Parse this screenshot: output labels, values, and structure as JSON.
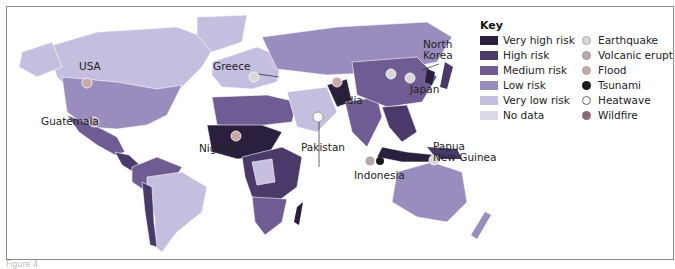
{
  "colors": {
    "very_high": "#2a1f3d",
    "high": "#4a3a6a",
    "medium": "#6e5c92",
    "low": "#9a8cbd",
    "very_low": "#c6bedf",
    "no_data": "#dcd8e6",
    "earthquake": "#d8d8d8",
    "volcanic": "#b8a8b0",
    "flood": "#c9a8a8",
    "tsunami": "#1c1c1c",
    "heatwave": "#ffffff",
    "wildfire": "#8a6a78"
  },
  "key": {
    "title": "Key",
    "risk_levels": [
      {
        "label": "Very high risk",
        "color": "#2a1f3d"
      },
      {
        "label": "High risk",
        "color": "#4a3a6a"
      },
      {
        "label": "Medium risk",
        "color": "#6e5c92"
      },
      {
        "label": "Low risk",
        "color": "#9a8cbd"
      },
      {
        "label": "Very low risk",
        "color": "#c6bedf"
      },
      {
        "label": "No data",
        "color": "#dcd8e6"
      }
    ],
    "hazards": [
      {
        "label": "Earthquake",
        "icon": "earthquake-dot-icon"
      },
      {
        "label": "Volcanic eruption",
        "icon": "volcano-dot-icon"
      },
      {
        "label": "Flood",
        "icon": "flood-dot-icon"
      },
      {
        "label": "Tsunami",
        "icon": "tsunami-dot-icon"
      },
      {
        "label": "Heatwave",
        "icon": "heatwave-dot-icon"
      },
      {
        "label": "Wildfire",
        "icon": "wildfire-dot-icon"
      }
    ]
  },
  "places": {
    "usa": "USA",
    "greece": "Greece",
    "guatemala": "Guatemala",
    "nigeria": "Nigeria",
    "pakistan": "Pakistan",
    "india": "India",
    "north_korea_1": "North",
    "north_korea_2": "Korea",
    "japan": "Japan",
    "indonesia": "Indonesia",
    "png_1": "Papua",
    "png_2": "New Guinea"
  },
  "caption": "Figure 4"
}
